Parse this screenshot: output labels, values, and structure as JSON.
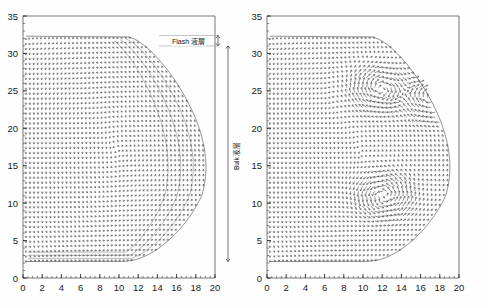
{
  "figure": {
    "title": "",
    "panel_count": 2,
    "background_color": "#fefefe",
    "ink_color": "#2b2b2b"
  },
  "annotations": {
    "flash_layer_label": "Flash 液層",
    "bulk_layer_label": "Bulk 液層"
  },
  "chart_data": [
    {
      "type": "scatter",
      "subtype": "quiver-vector-field",
      "panel": "left",
      "title": "",
      "xlabel": "",
      "ylabel": "",
      "xlim": [
        0,
        20
      ],
      "ylim": [
        0,
        35
      ],
      "xticks": [
        0,
        2,
        4,
        6,
        8,
        10,
        12,
        14,
        16,
        18,
        20
      ],
      "xtick_labels": [
        "0",
        "2",
        "4",
        "6",
        "8",
        "10",
        "12",
        "14",
        "16",
        "18",
        "20"
      ],
      "yticks": [
        0,
        5,
        10,
        15,
        20,
        25,
        30,
        35
      ],
      "ytick_labels": [
        "0",
        "5",
        "10",
        "15",
        "20",
        "25",
        "30",
        "35"
      ],
      "minor_xtick_step": 0.5,
      "minor_ytick_step": 1,
      "grid": false,
      "legend": false,
      "flow_description": "Single large smooth recirculation: upward along left wall, across top at y≈32, descending along the curved right free boundary which bulges to x≈19.6 near y≈11, returning left along bottom at y≈2.5",
      "domain_bounds": {
        "bottom_y": 2.2,
        "top_y": 32.3,
        "left_x": 0.3,
        "max_right_x": 19.7
      },
      "flash_layer_range": [
        31.0,
        32.4
      ],
      "bulk_layer_range": [
        2.2,
        31.0
      ],
      "vortex_centers": []
    },
    {
      "type": "scatter",
      "subtype": "quiver-vector-field",
      "panel": "right",
      "title": "",
      "xlabel": "",
      "ylabel": "",
      "xlim": [
        0,
        20
      ],
      "ylim": [
        0,
        35
      ],
      "xticks": [
        0,
        2,
        4,
        6,
        8,
        10,
        12,
        14,
        16,
        18,
        20
      ],
      "xtick_labels": [
        "0",
        "2",
        "4",
        "6",
        "8",
        "10",
        "12",
        "14",
        "16",
        "18",
        "20"
      ],
      "yticks": [
        0,
        5,
        10,
        15,
        20,
        25,
        30,
        35
      ],
      "ytick_labels": [
        "0",
        "5",
        "10",
        "15",
        "20",
        "25",
        "30",
        "35"
      ],
      "minor_xtick_step": 0.5,
      "minor_ytick_step": 1,
      "grid": false,
      "legend": false,
      "flow_description": "Large outer recirculation with internal secondary vortices: a strong vortex near (12,11), a disturbed multi-cell region around (12,25) and (17,24)",
      "domain_bounds": {
        "bottom_y": 2.2,
        "top_y": 32.3,
        "left_x": 0.3,
        "max_right_x": 19.7
      },
      "vortex_centers": [
        {
          "x": 12.2,
          "y": 11.0,
          "sense": "clockwise"
        },
        {
          "x": 11.8,
          "y": 25.2,
          "sense": "counter-clockwise"
        },
        {
          "x": 17.0,
          "y": 24.0,
          "sense": "counter-clockwise"
        }
      ]
    }
  ]
}
